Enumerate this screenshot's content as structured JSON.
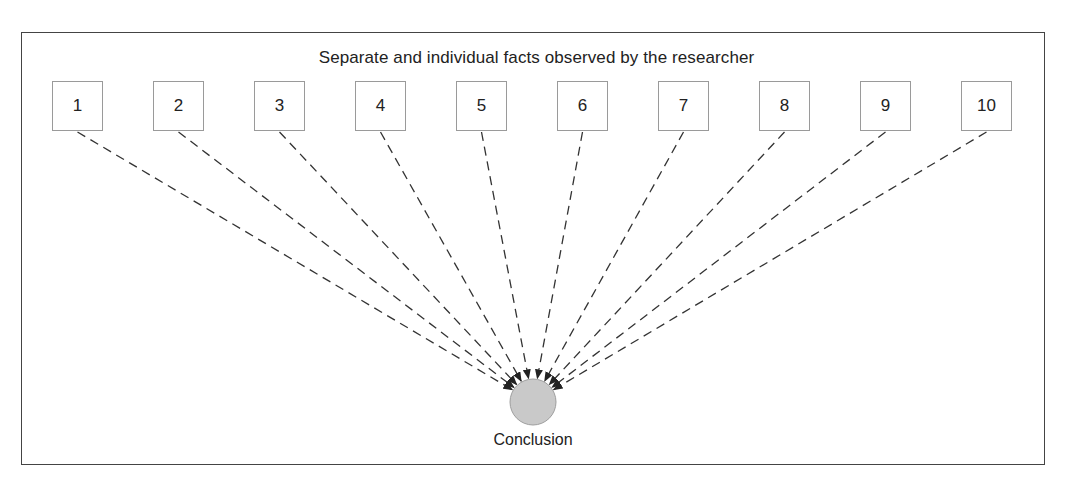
{
  "diagram": {
    "title": "Separate and individual facts observed by the researcher",
    "facts": [
      {
        "label": "1"
      },
      {
        "label": "2"
      },
      {
        "label": "3"
      },
      {
        "label": "4"
      },
      {
        "label": "5"
      },
      {
        "label": "6"
      },
      {
        "label": "7"
      },
      {
        "label": "8"
      },
      {
        "label": "9"
      },
      {
        "label": "10"
      }
    ],
    "conclusion": {
      "label": "Conclusion"
    },
    "colors": {
      "frame_border": "#444444",
      "box_border": "#9a9a9a",
      "arrow": "#333333",
      "conclusion_fill": "#c9c9c9",
      "conclusion_border": "#9e9e9e"
    }
  }
}
